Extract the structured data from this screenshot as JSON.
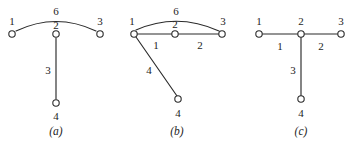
{
  "figure": {
    "colors": {
      "ink": "#2b2b2b",
      "background": "#ffffff"
    },
    "panels": [
      {
        "id": "a",
        "caption": "(a)",
        "caption_pos": {
          "x": 56,
          "y": 131
        },
        "nodes": [
          {
            "id": "n1",
            "label": "1",
            "x": 12,
            "y": 34,
            "label_x": 12,
            "label_y": 21
          },
          {
            "id": "n2",
            "label": "2",
            "x": 56,
            "y": 34,
            "label_x": 56,
            "label_y": 25
          },
          {
            "id": "n3",
            "label": "3",
            "x": 100,
            "y": 34,
            "label_x": 100,
            "label_y": 21
          },
          {
            "id": "n4",
            "label": "4",
            "x": 56,
            "y": 103,
            "label_x": 56,
            "label_y": 116
          }
        ],
        "edges": [
          {
            "from": "n1",
            "to": "n3",
            "weight": "6",
            "shape": "arc",
            "label_x": 56,
            "label_y": 11
          },
          {
            "from": "n2",
            "to": "n4",
            "weight": "3",
            "shape": "line",
            "label_x": 48,
            "label_y": 70
          }
        ]
      },
      {
        "id": "b",
        "caption": "(b)",
        "caption_pos": {
          "x": 62,
          "y": 131
        },
        "nodes": [
          {
            "id": "n1",
            "label": "1",
            "x": 19,
            "y": 34,
            "label_x": 17,
            "label_y": 21
          },
          {
            "id": "n2",
            "label": "2",
            "x": 60,
            "y": 34,
            "label_x": 60,
            "label_y": 24
          },
          {
            "id": "n3",
            "label": "3",
            "x": 107,
            "y": 34,
            "label_x": 108,
            "label_y": 21
          },
          {
            "id": "n4",
            "label": "4",
            "x": 63,
            "y": 99,
            "label_x": 63,
            "label_y": 113
          }
        ],
        "edges": [
          {
            "from": "n1",
            "to": "n3",
            "weight": "6",
            "shape": "arc",
            "label_x": 61,
            "label_y": 11
          },
          {
            "from": "n1",
            "to": "n2",
            "weight": "1",
            "shape": "line",
            "label_x": 41,
            "label_y": 45
          },
          {
            "from": "n2",
            "to": "n3",
            "weight": "2",
            "shape": "line",
            "label_x": 85,
            "label_y": 45
          },
          {
            "from": "n1",
            "to": "n4",
            "weight": "4",
            "shape": "line",
            "label_x": 34,
            "label_y": 70
          }
        ]
      },
      {
        "id": "c",
        "caption": "(c)",
        "caption_pos": {
          "x": 66,
          "y": 131
        },
        "nodes": [
          {
            "id": "n1",
            "label": "1",
            "x": 24,
            "y": 34,
            "label_x": 24,
            "label_y": 21
          },
          {
            "id": "n2",
            "label": "2",
            "x": 66,
            "y": 34,
            "label_x": 66,
            "label_y": 21
          },
          {
            "id": "n3",
            "label": "3",
            "x": 106,
            "y": 34,
            "label_x": 106,
            "label_y": 21
          },
          {
            "id": "n4",
            "label": "4",
            "x": 66,
            "y": 99,
            "label_x": 66,
            "label_y": 113
          }
        ],
        "edges": [
          {
            "from": "n1",
            "to": "n2",
            "weight": "1",
            "shape": "line",
            "label_x": 45,
            "label_y": 46
          },
          {
            "from": "n2",
            "to": "n3",
            "weight": "2",
            "shape": "line",
            "label_x": 86,
            "label_y": 46
          },
          {
            "from": "n2",
            "to": "n4",
            "weight": "3",
            "shape": "line",
            "label_x": 58,
            "label_y": 70
          }
        ]
      }
    ]
  }
}
